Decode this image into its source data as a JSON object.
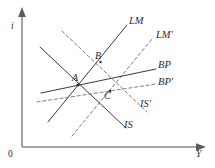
{
  "figure": {
    "axes": {
      "y_label": "i",
      "x_label": "Y",
      "origin_label": "0"
    },
    "curve_labels": {
      "lm": "LM",
      "lm_prime": "LM'",
      "bp": "BP",
      "bp_prime": "BP'",
      "is": "IS",
      "is_prime": "IS'"
    },
    "point_labels": {
      "a": "A",
      "b": "B",
      "c": "C"
    },
    "colors": {
      "axis": "#8a8a8a",
      "solid_curve": "#3a3a3a",
      "dashed_curve": "#7e7e7e",
      "point": "#2b2b2b",
      "background": "#ffffff"
    }
  },
  "chart_data": {
    "type": "line",
    "xlabel": "Y",
    "ylabel": "i",
    "grid": false,
    "legend": "inline-curve-labels",
    "xlim": [
      0,
      215
    ],
    "ylim": [
      0,
      168
    ],
    "axes_pixels": {
      "y_axis_x": 22,
      "y_axis_top": 10,
      "x_axis_y": 147,
      "x_axis_right": 205
    },
    "series": [
      {
        "name": "LM",
        "style": "solid",
        "points": [
          [
            48,
            122
          ],
          [
            127,
            25
          ]
        ]
      },
      {
        "name": "LM'",
        "style": "dashed",
        "points": [
          [
            72,
            136
          ],
          [
            152,
            39
          ]
        ]
      },
      {
        "name": "IS",
        "style": "solid",
        "points": [
          [
            40,
            47
          ],
          [
            126,
            128
          ]
        ]
      },
      {
        "name": "IS'",
        "style": "dashed",
        "points": [
          [
            62,
            31
          ],
          [
            147,
            112
          ]
        ]
      },
      {
        "name": "BP",
        "style": "solid",
        "points": [
          [
            41,
            93
          ],
          [
            156,
            69
          ]
        ]
      },
      {
        "name": "BP'",
        "style": "dashed",
        "points": [
          [
            37,
            102
          ],
          [
            156,
            84
          ]
        ]
      }
    ],
    "annotations": [
      {
        "label": "A",
        "x": 78,
        "y": 85,
        "note": "initial equilibrium IS x LM x BP"
      },
      {
        "label": "B",
        "x": 100,
        "y": 62,
        "note": "IS' x LM intersection"
      },
      {
        "label": "C",
        "x": 107,
        "y": 97,
        "note": "IS' x LM' x BP' intersection"
      }
    ]
  }
}
